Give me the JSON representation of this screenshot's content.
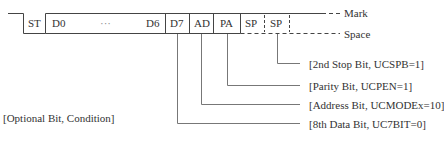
{
  "frame": {
    "fields": [
      {
        "id": "st",
        "label": "ST"
      },
      {
        "id": "d0",
        "label": "D0"
      },
      {
        "id": "dots",
        "label": "···"
      },
      {
        "id": "d6",
        "label": "D6"
      },
      {
        "id": "d7",
        "label": "D7"
      },
      {
        "id": "ad",
        "label": "AD"
      },
      {
        "id": "pa",
        "label": "PA"
      },
      {
        "id": "sp1",
        "label": "SP"
      },
      {
        "id": "sp2",
        "label": "SP"
      }
    ]
  },
  "levels": {
    "mark": "Mark",
    "space": "Space"
  },
  "annotations": {
    "stop2": "[2nd Stop Bit, UCSPB=1]",
    "parity": "[Parity Bit, UCPEN=1]",
    "address": "[Address Bit, UCMODEx=10]",
    "data8": "[8th Data Bit, UC7BIT=0]",
    "legend": "[Optional Bit, Condition]"
  }
}
